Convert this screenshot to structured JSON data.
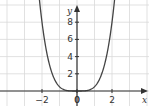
{
  "chart_data": {
    "type": "line",
    "title": "",
    "xlabel": "x",
    "ylabel": "y",
    "xlim": [
      -4.1,
      4.1
    ],
    "ylim": [
      -1.7,
      10.0
    ],
    "grid": true,
    "x_ticks": [
      -2,
      0,
      2
    ],
    "x_tick_labels": [
      "−2",
      "0",
      "2"
    ],
    "y_ticks": [
      2,
      4,
      6,
      8
    ],
    "y_tick_labels": [
      "2",
      "4",
      "6",
      "8"
    ],
    "series": [
      {
        "name": "curve",
        "function": "y ≈ 0.5·x^4",
        "x": [
          -2.3,
          -2.0,
          -1.5,
          -1.0,
          -0.5,
          0,
          0.5,
          1.0,
          1.5,
          2.0,
          2.3
        ],
        "y": [
          10.0,
          8.0,
          2.5,
          0.5,
          0.03,
          0,
          0.03,
          0.5,
          2.5,
          8.0,
          10.0
        ]
      }
    ],
    "colors": {
      "grid": "#d9d9d9",
      "axis": "#333333",
      "curve": "#444444"
    }
  }
}
